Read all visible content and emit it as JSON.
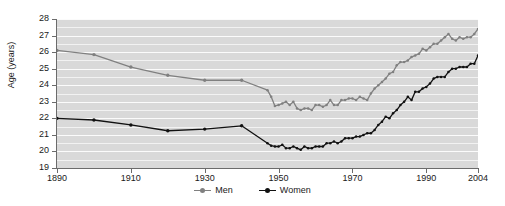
{
  "chart_data": {
    "type": "line",
    "title": "",
    "xlabel": "",
    "ylabel": "Age (years)",
    "xlim": [
      1890,
      2004
    ],
    "ylim": [
      19,
      28
    ],
    "grid": true,
    "legend_position": "bottom-center",
    "yticks": [
      19,
      20,
      21,
      22,
      23,
      24,
      25,
      26,
      27,
      28
    ],
    "xticks": [
      1890,
      1910,
      1930,
      1950,
      1970,
      1990,
      2004
    ],
    "colors": {
      "men": "#808080",
      "women": "#111111",
      "plot_background": "#d9d9d9",
      "gridline": "#f2f2f2",
      "axis": "#6b6b6b"
    },
    "series": [
      {
        "name": "Men",
        "color": "#808080",
        "points": [
          [
            1890,
            26.1
          ],
          [
            1900,
            25.85
          ],
          [
            1910,
            25.1
          ],
          [
            1920,
            24.6
          ],
          [
            1930,
            24.3
          ],
          [
            1940,
            24.3
          ],
          [
            1947,
            23.7
          ],
          [
            1948,
            23.3
          ],
          [
            1949,
            22.75
          ],
          [
            1950,
            22.8
          ],
          [
            1951,
            22.9
          ],
          [
            1952,
            23.0
          ],
          [
            1953,
            22.8
          ],
          [
            1954,
            23.0
          ],
          [
            1955,
            22.6
          ],
          [
            1956,
            22.5
          ],
          [
            1957,
            22.6
          ],
          [
            1958,
            22.6
          ],
          [
            1959,
            22.5
          ],
          [
            1960,
            22.8
          ],
          [
            1961,
            22.8
          ],
          [
            1962,
            22.7
          ],
          [
            1963,
            22.8
          ],
          [
            1964,
            23.1
          ],
          [
            1965,
            22.8
          ],
          [
            1966,
            22.8
          ],
          [
            1967,
            23.1
          ],
          [
            1968,
            23.1
          ],
          [
            1969,
            23.2
          ],
          [
            1970,
            23.2
          ],
          [
            1971,
            23.1
          ],
          [
            1972,
            23.3
          ],
          [
            1973,
            23.2
          ],
          [
            1974,
            23.1
          ],
          [
            1975,
            23.5
          ],
          [
            1976,
            23.8
          ],
          [
            1977,
            24.0
          ],
          [
            1978,
            24.2
          ],
          [
            1979,
            24.4
          ],
          [
            1980,
            24.7
          ],
          [
            1981,
            24.8
          ],
          [
            1982,
            25.2
          ],
          [
            1983,
            25.4
          ],
          [
            1984,
            25.4
          ],
          [
            1985,
            25.5
          ],
          [
            1986,
            25.7
          ],
          [
            1987,
            25.8
          ],
          [
            1988,
            25.9
          ],
          [
            1989,
            26.2
          ],
          [
            1990,
            26.1
          ],
          [
            1991,
            26.3
          ],
          [
            1992,
            26.5
          ],
          [
            1993,
            26.5
          ],
          [
            1994,
            26.7
          ],
          [
            1995,
            26.9
          ],
          [
            1996,
            27.1
          ],
          [
            1997,
            26.8
          ],
          [
            1998,
            26.7
          ],
          [
            1999,
            26.9
          ],
          [
            2000,
            26.8
          ],
          [
            2001,
            26.9
          ],
          [
            2002,
            26.9
          ],
          [
            2003,
            27.1
          ],
          [
            2004,
            27.4
          ]
        ],
        "marker_years": [
          1890,
          1900,
          1910,
          1920,
          1930,
          1940
        ]
      },
      {
        "name": "Women",
        "color": "#111111",
        "points": [
          [
            1890,
            22.0
          ],
          [
            1900,
            21.9
          ],
          [
            1910,
            21.6
          ],
          [
            1920,
            21.25
          ],
          [
            1930,
            21.35
          ],
          [
            1940,
            21.55
          ],
          [
            1947,
            20.5
          ],
          [
            1948,
            20.35
          ],
          [
            1949,
            20.3
          ],
          [
            1950,
            20.3
          ],
          [
            1951,
            20.4
          ],
          [
            1952,
            20.2
          ],
          [
            1953,
            20.2
          ],
          [
            1954,
            20.3
          ],
          [
            1955,
            20.2
          ],
          [
            1956,
            20.1
          ],
          [
            1957,
            20.3
          ],
          [
            1958,
            20.2
          ],
          [
            1959,
            20.2
          ],
          [
            1960,
            20.3
          ],
          [
            1961,
            20.3
          ],
          [
            1962,
            20.3
          ],
          [
            1963,
            20.5
          ],
          [
            1964,
            20.5
          ],
          [
            1965,
            20.6
          ],
          [
            1966,
            20.5
          ],
          [
            1967,
            20.6
          ],
          [
            1968,
            20.8
          ],
          [
            1969,
            20.8
          ],
          [
            1970,
            20.8
          ],
          [
            1971,
            20.9
          ],
          [
            1972,
            20.9
          ],
          [
            1973,
            21.0
          ],
          [
            1974,
            21.1
          ],
          [
            1975,
            21.1
          ],
          [
            1976,
            21.3
          ],
          [
            1977,
            21.6
          ],
          [
            1978,
            21.8
          ],
          [
            1979,
            22.1
          ],
          [
            1980,
            22.0
          ],
          [
            1981,
            22.3
          ],
          [
            1982,
            22.5
          ],
          [
            1983,
            22.8
          ],
          [
            1984,
            23.0
          ],
          [
            1985,
            23.3
          ],
          [
            1986,
            23.1
          ],
          [
            1987,
            23.6
          ],
          [
            1988,
            23.6
          ],
          [
            1989,
            23.8
          ],
          [
            1990,
            23.9
          ],
          [
            1991,
            24.1
          ],
          [
            1992,
            24.4
          ],
          [
            1993,
            24.5
          ],
          [
            1994,
            24.5
          ],
          [
            1995,
            24.5
          ],
          [
            1996,
            24.8
          ],
          [
            1997,
            25.0
          ],
          [
            1998,
            25.0
          ],
          [
            1999,
            25.1
          ],
          [
            2000,
            25.1
          ],
          [
            2001,
            25.1
          ],
          [
            2002,
            25.3
          ],
          [
            2003,
            25.3
          ],
          [
            2004,
            25.8
          ]
        ],
        "marker_years": [
          1890,
          1900,
          1910,
          1920,
          1930,
          1940
        ]
      }
    ]
  },
  "legend": {
    "items": [
      {
        "label": "Men",
        "color": "#808080"
      },
      {
        "label": "Women",
        "color": "#111111"
      }
    ]
  },
  "axis": {
    "y_title": "Age (years)",
    "y_tick_labels": [
      "28",
      "27",
      "26",
      "25",
      "24",
      "23",
      "22",
      "21",
      "20",
      "19"
    ],
    "x_tick_labels": [
      "1890",
      "1910",
      "1930",
      "1950",
      "1970",
      "1990",
      "2004"
    ]
  }
}
